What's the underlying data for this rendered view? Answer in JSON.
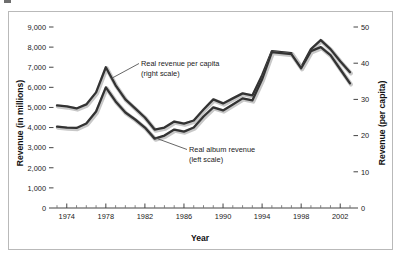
{
  "figure": {
    "background_color": "#ffffff",
    "frame_color": "#b9b9b9",
    "line_color": "#333333",
    "line_shadow_color": "#c8c8c8"
  },
  "chart_data": {
    "type": "line",
    "title": "",
    "xlabel": "Year",
    "ylabel": "Revenue (in millions)",
    "ylabel_right": "Revenue (per capita)",
    "grid": false,
    "legend_position": "inline-annotations",
    "xlim": [
      1973,
      2003
    ],
    "ylim": [
      0,
      9000
    ],
    "ylim_right": [
      0,
      50
    ],
    "xticks_major": [
      1974,
      1978,
      1982,
      1986,
      1990,
      1994,
      1998,
      2002
    ],
    "xticklabels": [
      "1974",
      "1978",
      "1982",
      "1986",
      "1990",
      "1994",
      "1998",
      "2002"
    ],
    "xticks_minor": [
      1973,
      1975,
      1976,
      1977,
      1979,
      1980,
      1981,
      1983,
      1984,
      1985,
      1987,
      1988,
      1989,
      1991,
      1992,
      1993,
      1995,
      1996,
      1997,
      1999,
      2000,
      2001,
      2003
    ],
    "yticks": [
      0,
      1000,
      2000,
      3000,
      4000,
      5000,
      6000,
      7000,
      8000,
      9000
    ],
    "yticklabels": [
      "0",
      "1,000",
      "2,000",
      "3,000",
      "4,000",
      "5,000",
      "6,000",
      "7,000",
      "8,000",
      "9,000"
    ],
    "yticks_right": [
      0,
      10,
      20,
      30,
      40,
      50
    ],
    "yticklabels_right": [
      "0",
      "10",
      "20",
      "30",
      "40",
      "50"
    ],
    "x": [
      1973,
      1974,
      1975,
      1976,
      1977,
      1978,
      1979,
      1980,
      1981,
      1982,
      1983,
      1984,
      1985,
      1986,
      1987,
      1988,
      1989,
      1990,
      1991,
      1992,
      1993,
      1994,
      1995,
      1996,
      1997,
      1998,
      1999,
      2000,
      2001,
      2002,
      2003
    ],
    "series": [
      {
        "name": "Real revenue per capita (right scale)",
        "axis": "right",
        "annotation": "Real revenue per capita\n(right scale)",
        "values_left_scale_equivalent": [
          5100,
          5050,
          4950,
          5150,
          5750,
          7000,
          6100,
          5400,
          4950,
          4500,
          3900,
          4000,
          4300,
          4200,
          4350,
          4900,
          5400,
          5200,
          5450,
          5700,
          5600,
          6600,
          7800,
          7750,
          7700,
          7000,
          7900,
          8350,
          7900,
          7300,
          6750
        ],
        "values": [
          28.3,
          28.1,
          27.5,
          28.6,
          31.9,
          38.9,
          33.9,
          30.0,
          27.5,
          25.0,
          21.7,
          22.2,
          23.9,
          23.3,
          24.2,
          27.2,
          30.0,
          28.9,
          30.3,
          31.7,
          31.1,
          36.7,
          43.3,
          43.1,
          42.8,
          38.9,
          43.9,
          46.4,
          43.9,
          40.6,
          37.5
        ]
      },
      {
        "name": "Real album revenue (left scale)",
        "axis": "left",
        "annotation": "Real album revenue\n(left scale)",
        "values": [
          4050,
          4000,
          3980,
          4200,
          4800,
          6000,
          5300,
          4750,
          4400,
          4000,
          3450,
          3600,
          3900,
          3800,
          4000,
          4550,
          5000,
          4850,
          5150,
          5450,
          5350,
          6400,
          7750,
          7700,
          7650,
          6950,
          7800,
          8000,
          7600,
          6900,
          6200
        ]
      }
    ],
    "annotations": [
      {
        "id": "upper-annotation",
        "lines": [
          "Real revenue per capita",
          "(right scale)"
        ],
        "points_to": "upper-curve"
      },
      {
        "id": "lower-annotation",
        "lines": [
          "Real album revenue",
          "(left scale)"
        ],
        "points_to": "lower-curve"
      }
    ]
  }
}
